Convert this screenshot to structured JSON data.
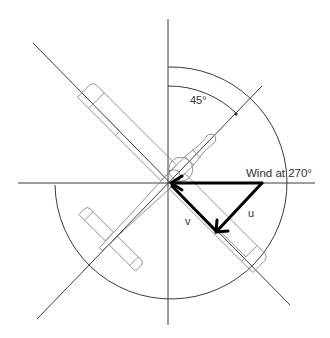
{
  "diagram": {
    "type": "wind-component-vector-diagram",
    "labels": {
      "angle": "45°",
      "wind": "Wind at 270°",
      "u": "u",
      "v": "v"
    },
    "colors": {
      "axis": "#3a3a3a",
      "aircraft_outline": "#8a8a8a",
      "arrow": "#000000",
      "background": "#ffffff"
    },
    "elements": {
      "axes": [
        "vertical",
        "horizontal",
        "diagonal-nw-se",
        "diagonal-ne-sw"
      ],
      "arcs": [
        "outer-circle",
        "inner-45-arc"
      ],
      "aircraft": "plan-view outline oriented along NW-SE diagonal, nose toward NE",
      "vectors": [
        "wind",
        "u-component",
        "v-component"
      ]
    }
  }
}
